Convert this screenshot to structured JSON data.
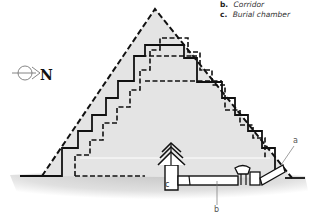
{
  "legend": {
    "items": [
      {
        "key": "b.",
        "label": "Corridor"
      },
      {
        "key": "c.",
        "label": "Burial chamber"
      }
    ]
  },
  "compass": {
    "icon": "north-arrow-icon",
    "label": "N"
  },
  "callouts": {
    "a": "a",
    "b": "b",
    "c": "c"
  },
  "colors": {
    "pyramid_fill": "#e6e6e6",
    "outline": "#111111",
    "ground": "#cfcfcf",
    "background": "#ffffff"
  }
}
